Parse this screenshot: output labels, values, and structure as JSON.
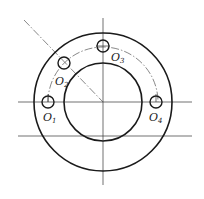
{
  "diagram": {
    "type": "engineering-drawing",
    "colors": {
      "line": "#1a1a1a",
      "background": "#ffffff"
    },
    "center": {
      "x": 103,
      "y": 102
    },
    "outer_circle_radius": 69,
    "inner_circle_radius": 39,
    "bolt_circle_radius": 55,
    "hole_radius": 6,
    "holes": [
      {
        "id": "O1",
        "letter": "O",
        "sub": "1",
        "x": 48,
        "y": 102
      },
      {
        "id": "O2",
        "letter": "O",
        "sub": "2",
        "x": 64,
        "y": 63
      },
      {
        "id": "O3",
        "letter": "O",
        "sub": "3",
        "x": 103,
        "y": 47
      },
      {
        "id": "O4",
        "letter": "O",
        "sub": "4",
        "x": 158,
        "y": 102
      }
    ]
  }
}
